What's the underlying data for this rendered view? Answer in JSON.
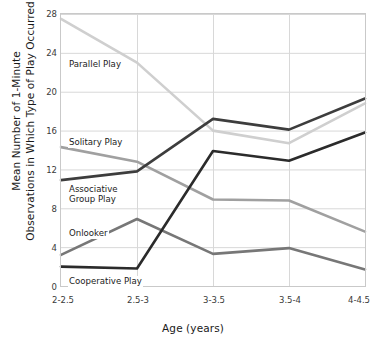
{
  "chart_data": {
    "type": "line",
    "title": "",
    "xlabel": "Age (years)",
    "ylabel": "Mean Number of 1-Minute Observations in Which  Type of Play Occurred",
    "ylabel_line1": "Mean Number of 1-Minute",
    "ylabel_line2": "Observations in Which  Type of Play Occurred",
    "categories": [
      "2-2.5",
      "2.5-3",
      "3-3.5",
      "3.5-4",
      "4-4.5"
    ],
    "ylim": [
      0,
      28
    ],
    "yticks": [
      0,
      4,
      8,
      12,
      16,
      20,
      24,
      28
    ],
    "ytick_labels": [
      "0",
      "4",
      "8",
      "12",
      "16",
      "20",
      "24",
      "28"
    ],
    "grid": true,
    "grid_color": "#d8d8d8",
    "legend_position": "inline-annotations",
    "series": [
      {
        "name": "Parallel Play",
        "color": "#cfcfcf",
        "values": [
          27.5,
          23.0,
          16.0,
          14.7,
          18.8
        ]
      },
      {
        "name": "Solitary Play",
        "color": "#a0a0a0",
        "values": [
          14.3,
          12.8,
          8.9,
          8.8,
          5.6
        ]
      },
      {
        "name": "Associative Group Play",
        "color": "#3d3d3d",
        "values": [
          10.9,
          11.8,
          17.2,
          16.1,
          19.3
        ]
      },
      {
        "name": "Onlooker",
        "color": "#777777",
        "values": [
          3.2,
          6.9,
          3.3,
          3.9,
          1.7
        ]
      },
      {
        "name": "Cooperative Play",
        "color": "#2b2b2b",
        "values": [
          2.0,
          1.8,
          13.9,
          12.9,
          15.8
        ]
      }
    ],
    "annotations": [
      {
        "text": "Parallel Play",
        "series": "Parallel Play"
      },
      {
        "text": "Solitary Play",
        "series": "Solitary Play"
      },
      {
        "text": "Associative",
        "series": "Associative Group Play"
      },
      {
        "text": "Group Play",
        "series": "Associative Group Play"
      },
      {
        "text": "Onlooker",
        "series": "Onlooker"
      },
      {
        "text": "Cooperative Play",
        "series": "Cooperative Play"
      }
    ]
  }
}
